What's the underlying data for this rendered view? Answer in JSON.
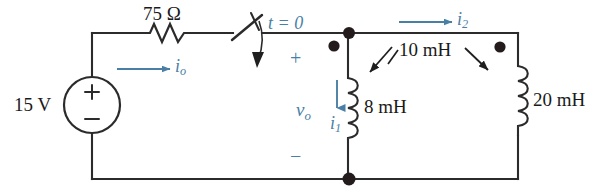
{
  "figure": {
    "type": "circuit-schematic",
    "colors": {
      "wire": "#2b2b2b",
      "label_black": "#1a1a1a",
      "label_blue": "#4a7fa5",
      "node_dot": "#241c1c",
      "background": "#ffffff"
    }
  },
  "components": {
    "source": {
      "name": "voltage-source",
      "value_label": "15 V",
      "plus_label": "+",
      "minus_label": "−"
    },
    "resistor": {
      "name": "resistor",
      "value_label": "75 Ω"
    },
    "switch": {
      "name": "switch",
      "time_label_t": "t",
      "time_label_eq": "=",
      "time_label_val": "0",
      "time_label": "t = 0"
    },
    "inductor_left": {
      "name": "inductor-8mh",
      "value_label": "8 mH"
    },
    "inductor_right": {
      "name": "inductor-20mh",
      "value_label": "20 mH"
    },
    "mutual": {
      "name": "mutual-inductance",
      "value_label": "10 mH"
    }
  },
  "annotations": {
    "current_io": {
      "symbol": "i",
      "subscript": "o"
    },
    "current_i1": {
      "symbol": "i",
      "subscript": "1"
    },
    "current_i2": {
      "symbol": "i",
      "subscript": "2"
    },
    "voltage_vo": {
      "symbol": "v",
      "subscript": "o"
    },
    "vo_plus": "+",
    "vo_minus": "−"
  }
}
